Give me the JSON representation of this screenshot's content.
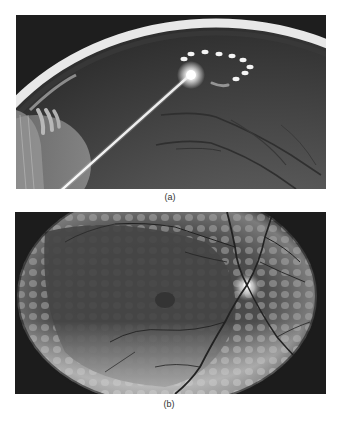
{
  "figure": {
    "panels": [
      {
        "id": "a",
        "caption": "(a)",
        "description": "Illustration of eye cross-section with laser beam focused on retina, producing a ring of laser spots",
        "image_type": "grayscale-photo",
        "colors": {
          "background": "#1e1e1e",
          "sclera_rim": "#e6e6e6",
          "retina": "#5a5a5a",
          "laser": "#ffffff"
        }
      },
      {
        "id": "b",
        "caption": "(b)",
        "description": "Fundus photograph showing panretinal laser photocoagulation scars surrounding the macula and optic disc",
        "image_type": "grayscale-photo",
        "colors": {
          "background": "#1c1c1c",
          "fundus": "#4a4a4a",
          "scars": "#9a9a9a",
          "optic_disc": "#f0f0f0"
        }
      }
    ]
  }
}
